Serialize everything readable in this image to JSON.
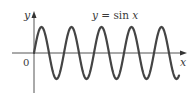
{
  "chart_data": {
    "type": "line",
    "title": "y = sin x",
    "xlabel": "x",
    "ylabel": "y",
    "origin_label": "0",
    "function": "sin",
    "cycles_shown": 5,
    "x_range": [
      0,
      31.4
    ],
    "ylim": [
      -1,
      1
    ],
    "grid": false,
    "legend": null,
    "series": [
      {
        "name": "y = sin x",
        "color": "#444444"
      }
    ]
  },
  "labels": {
    "curve": "y = sin x",
    "x_axis": "x",
    "y_axis": "y",
    "origin": "0"
  },
  "colors": {
    "axis": "#555555",
    "curve": "#444444",
    "text": "#3a3a3a"
  }
}
